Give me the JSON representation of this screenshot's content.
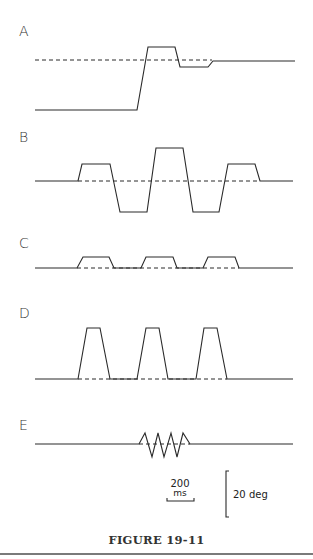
{
  "figure": {
    "caption": "FIGURE 19-11",
    "panels": [
      {
        "label": "A",
        "label_pos": [
          19,
          36
        ],
        "trace": [
          [
            35,
            110
          ],
          [
            137,
            110
          ],
          [
            148,
            47
          ],
          [
            175,
            47
          ],
          [
            180,
            67
          ],
          [
            208,
            67
          ],
          [
            213,
            61
          ],
          [
            295,
            61
          ]
        ],
        "target": [
          [
            35,
            60
          ],
          [
            212,
            60
          ]
        ]
      },
      {
        "label": "B",
        "label_pos": [
          19,
          142
        ],
        "trace": [
          [
            35,
            181
          ],
          [
            78,
            181
          ],
          [
            82,
            164
          ],
          [
            110,
            164
          ],
          [
            120,
            212
          ],
          [
            147,
            212
          ],
          [
            156,
            148
          ],
          [
            183,
            148
          ],
          [
            193,
            212
          ],
          [
            219,
            212
          ],
          [
            228,
            164
          ],
          [
            255,
            164
          ],
          [
            260,
            181
          ],
          [
            293,
            181
          ]
        ],
        "target": [
          [
            78,
            181
          ],
          [
            260,
            181
          ]
        ]
      },
      {
        "label": "C",
        "label_pos": [
          19,
          248
        ],
        "trace": [
          [
            35,
            268
          ],
          [
            77,
            268
          ],
          [
            83,
            257
          ],
          [
            109,
            257
          ],
          [
            114,
            268
          ],
          [
            141,
            268
          ],
          [
            146,
            257
          ],
          [
            173,
            257
          ],
          [
            177,
            268
          ],
          [
            203,
            268
          ],
          [
            208,
            257
          ],
          [
            235,
            257
          ],
          [
            239,
            268
          ],
          [
            293,
            268
          ]
        ],
        "target": [
          [
            77,
            268
          ],
          [
            239,
            268
          ]
        ]
      },
      {
        "label": "D",
        "label_pos": [
          19,
          318
        ],
        "trace": [
          [
            35,
            379
          ],
          [
            78,
            379
          ],
          [
            87,
            328
          ],
          [
            100,
            328
          ],
          [
            110,
            379
          ],
          [
            137,
            379
          ],
          [
            146,
            328
          ],
          [
            159,
            328
          ],
          [
            168,
            379
          ],
          [
            196,
            379
          ],
          [
            204,
            328
          ],
          [
            217,
            328
          ],
          [
            227,
            379
          ],
          [
            293,
            379
          ]
        ],
        "target": [
          [
            78,
            379
          ],
          [
            227,
            379
          ]
        ]
      },
      {
        "label": "E",
        "label_pos": [
          19,
          430
        ],
        "trace": [
          [
            35,
            444
          ],
          [
            139,
            444
          ],
          [
            145,
            433
          ],
          [
            152,
            457
          ],
          [
            158,
            433
          ],
          [
            164,
            457
          ],
          [
            171,
            433
          ],
          [
            177,
            457
          ],
          [
            183,
            433
          ],
          [
            190,
            444
          ],
          [
            293,
            444
          ]
        ],
        "target": [
          [
            139,
            444
          ],
          [
            190,
            444
          ]
        ]
      }
    ],
    "scale_bars": {
      "time": {
        "value": "200",
        "unit": "ms",
        "x1": 167,
        "x2": 194,
        "y": 501
      },
      "amplitude": {
        "label": "20 deg",
        "x": 226,
        "y1": 471,
        "y2": 517
      }
    }
  }
}
